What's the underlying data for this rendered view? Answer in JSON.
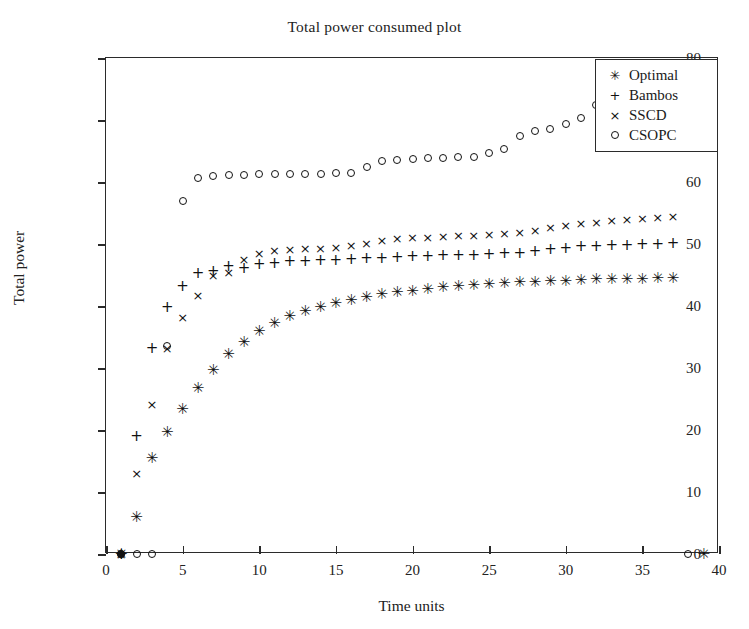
{
  "chart_data": {
    "type": "scatter",
    "title": "Total power consumed plot",
    "xlabel": "Time units",
    "ylabel": "Total power",
    "xlim": [
      0,
      40
    ],
    "ylim": [
      0,
      80
    ],
    "xticks": [
      0,
      5,
      10,
      15,
      20,
      25,
      30,
      35,
      40
    ],
    "yticks": [
      0,
      10,
      20,
      30,
      40,
      50,
      60,
      70,
      80
    ],
    "grid": false,
    "legend_position": "top-right",
    "series": [
      {
        "name": "Optimal",
        "marker": "asterisk",
        "marker_glyph": "✳",
        "x": [
          1,
          2,
          3,
          4,
          5,
          6,
          7,
          8,
          9,
          10,
          11,
          12,
          13,
          14,
          15,
          16,
          17,
          18,
          19,
          20,
          21,
          22,
          23,
          24,
          25,
          26,
          27,
          28,
          29,
          30,
          31,
          32,
          33,
          34,
          35,
          36,
          37,
          39
        ],
        "y": [
          0,
          5.9,
          15.5,
          19.6,
          23.4,
          26.8,
          29.6,
          32.2,
          34.2,
          36.0,
          37.3,
          38.4,
          39.2,
          39.9,
          40.5,
          41.0,
          41.5,
          41.9,
          42.2,
          42.5,
          42.8,
          43.0,
          43.2,
          43.4,
          43.5,
          43.7,
          43.8,
          43.9,
          44.0,
          44.1,
          44.2,
          44.3,
          44.3,
          44.4,
          44.4,
          44.5,
          44.5,
          0
        ]
      },
      {
        "name": "Bambos",
        "marker": "plus",
        "marker_glyph": "+",
        "x": [
          1,
          2,
          3,
          4,
          5,
          6,
          7,
          8,
          9,
          10,
          11,
          12,
          13,
          14,
          15,
          16,
          17,
          18,
          19,
          20,
          21,
          22,
          23,
          24,
          25,
          26,
          27,
          28,
          29,
          30,
          31,
          32,
          33,
          34,
          35,
          36,
          37
        ],
        "y": [
          0,
          19.0,
          33.3,
          39.8,
          43.2,
          45.3,
          45.6,
          46.4,
          46.2,
          46.8,
          47.0,
          47.2,
          47.3,
          47.4,
          47.5,
          47.6,
          47.7,
          47.8,
          47.9,
          48.0,
          48.1,
          48.2,
          48.2,
          48.3,
          48.4,
          48.5,
          48.6,
          48.8,
          49.2,
          49.4,
          49.6,
          49.7,
          49.8,
          49.9,
          50.0,
          50.0,
          50.1
        ]
      },
      {
        "name": "SSCD",
        "marker": "cross",
        "marker_glyph": "×",
        "x": [
          1,
          2,
          3,
          4,
          5,
          6,
          7,
          8,
          9,
          10,
          11,
          12,
          13,
          14,
          15,
          16,
          17,
          18,
          19,
          20,
          21,
          22,
          23,
          24,
          25,
          26,
          27,
          28,
          29,
          30,
          31,
          32,
          33,
          34,
          35,
          36,
          37
        ],
        "y": [
          0,
          13.0,
          24.2,
          33.2,
          38.3,
          41.8,
          45.0,
          45.5,
          47.6,
          48.5,
          49.0,
          49.2,
          49.3,
          49.4,
          49.5,
          49.8,
          50.2,
          50.6,
          50.9,
          51.1,
          51.2,
          51.3,
          51.4,
          51.5,
          51.6,
          51.7,
          51.9,
          52.3,
          52.8,
          53.1,
          53.4,
          53.6,
          53.8,
          54.0,
          54.2,
          54.3,
          54.5
        ]
      },
      {
        "name": "CSOPC",
        "marker": "circle",
        "marker_glyph": "○",
        "x": [
          1,
          2,
          3,
          4,
          5,
          6,
          7,
          8,
          9,
          10,
          11,
          12,
          13,
          14,
          15,
          16,
          17,
          18,
          19,
          20,
          21,
          22,
          23,
          24,
          25,
          26,
          27,
          28,
          29,
          30,
          31,
          32,
          38
        ],
        "y": [
          0,
          0,
          0,
          33.5,
          57.0,
          60.6,
          61.0,
          61.1,
          61.2,
          61.3,
          61.3,
          61.3,
          61.3,
          61.3,
          61.4,
          61.4,
          62.4,
          63.4,
          63.6,
          63.7,
          63.8,
          63.9,
          64.0,
          64.1,
          64.6,
          65.4,
          67.4,
          68.2,
          68.6,
          69.3,
          70.4,
          72.4,
          0
        ]
      }
    ],
    "extra_points": [
      {
        "series": "Optimal",
        "x": 1,
        "y": 0,
        "filled": true,
        "note": "filled marker at origin region"
      }
    ]
  },
  "legend": {
    "items": [
      {
        "label": "Optimal",
        "glyph": "✳"
      },
      {
        "label": "Bambos",
        "glyph": "+"
      },
      {
        "label": "SSCD",
        "glyph": "×"
      },
      {
        "label": "CSOPC",
        "glyph": "○"
      }
    ]
  },
  "colors": {
    "axis": "#2b2b2b",
    "marker": "#111111",
    "text": "#1a1a1a",
    "background": "#ffffff"
  }
}
